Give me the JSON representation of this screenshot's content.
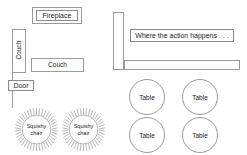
{
  "diagram": {
    "colors": {
      "stroke": "#9a9a9a",
      "label_stroke": "#8a8a8a",
      "text": "#1a1a1a",
      "background": "#ffffff"
    },
    "left_area": {
      "fireplace": {
        "label": "Fireplace"
      },
      "couch_vertical": {
        "label": "Couch"
      },
      "couch_horizontal": {
        "label": "Couch"
      },
      "door": {
        "label": "Door"
      },
      "squishy_chairs": [
        {
          "line1": "Squishy",
          "line2": "chair"
        },
        {
          "line1": "Squishy",
          "line2": "chair"
        }
      ]
    },
    "right_area": {
      "action_label": "Where the action happens . . .",
      "tables": [
        {
          "label": "Table"
        },
        {
          "label": "Table"
        },
        {
          "label": "Table"
        },
        {
          "label": "Table"
        }
      ]
    }
  }
}
